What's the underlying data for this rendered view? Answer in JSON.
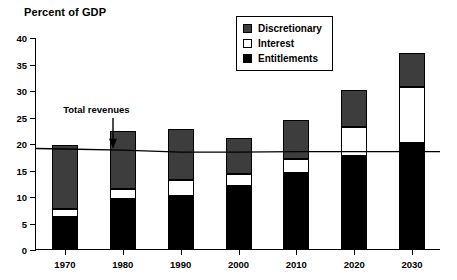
{
  "chart_data": {
    "type": "bar",
    "title": "Percent of GDP",
    "xlabel": "",
    "ylabel": "",
    "ylim": [
      0,
      40
    ],
    "ytick_step": 5,
    "yticks": [
      0,
      5,
      10,
      15,
      20,
      25,
      30,
      35,
      40
    ],
    "grid": false,
    "stacked": true,
    "legend_position": "top-right",
    "categories": [
      "1970",
      "1980",
      "1990",
      "2000",
      "2010",
      "2020",
      "2030"
    ],
    "series": [
      {
        "name": "Entitlements",
        "color": "#000000",
        "values": [
          6.1,
          9.5,
          10.0,
          11.9,
          14.3,
          17.5,
          20.0
        ]
      },
      {
        "name": "Interest",
        "color": "#ffffff",
        "values": [
          1.4,
          1.9,
          3.0,
          2.3,
          2.7,
          5.5,
          10.5
        ]
      },
      {
        "name": "Discretionary",
        "color": "#3d3d3d",
        "values": [
          12.2,
          10.9,
          9.7,
          6.8,
          7.3,
          7.0,
          6.5
        ]
      }
    ],
    "totals": [
      19.7,
      22.3,
      22.7,
      21.0,
      24.3,
      30.0,
      37.0
    ],
    "overlay_line": {
      "name": "Total revenues",
      "color": "#000000",
      "x": [
        "1970",
        "1980",
        "1990",
        "2000",
        "2010",
        "2020",
        "2030"
      ],
      "values": [
        19.0,
        18.8,
        18.4,
        18.4,
        18.5,
        18.5,
        18.5
      ]
    },
    "annotations": [
      {
        "text": "Total revenues",
        "x": "1975",
        "y": 26.5,
        "arrow": "down"
      }
    ]
  },
  "legend": {
    "items": [
      {
        "label": "Discretionary",
        "swatch": "discretionary"
      },
      {
        "label": "Interest",
        "swatch": "interest"
      },
      {
        "label": "Entitlements",
        "swatch": "entitlements"
      }
    ]
  },
  "annotation": {
    "label": "Total revenues"
  }
}
